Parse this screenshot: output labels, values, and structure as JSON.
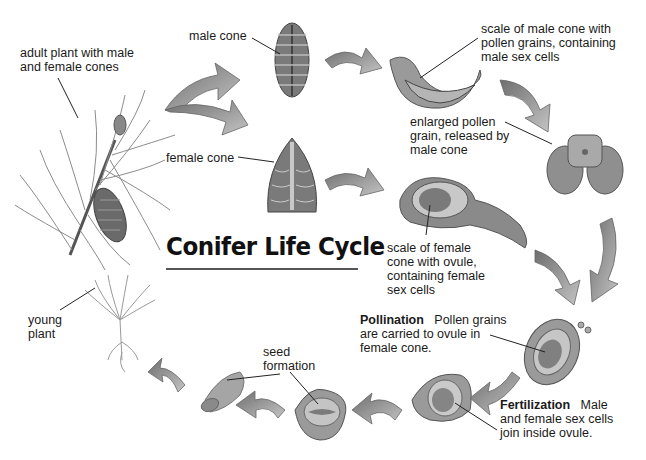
{
  "title": "Conifer Life Cycle",
  "labels": {
    "adult_plant": [
      "adult plant with male",
      "and female cones"
    ],
    "male_cone": "male cone",
    "female_cone": "female cone",
    "male_scale": [
      "scale of male cone with",
      "pollen grains, containing",
      "male sex cells"
    ],
    "pollen_grain": [
      "enlarged pollen",
      "grain, released by",
      "male cone"
    ],
    "female_scale": [
      "scale of female",
      "cone with ovule,",
      "containing female",
      "sex cells"
    ],
    "pollination": {
      "term": "Pollination",
      "text1": "Pollen grains",
      "text2": "are carried to ovule in",
      "text3": "female cone."
    },
    "fertilization": {
      "term": "Fertilization",
      "text1": "Male",
      "text2": "and female sex cells",
      "text3": "join inside ovule."
    },
    "seed_formation": [
      "seed",
      "formation"
    ],
    "young_plant": [
      "young",
      "plant"
    ]
  },
  "stages": [
    "adult plant",
    "male cone",
    "female cone",
    "male cone scale",
    "pollen grain",
    "female cone scale",
    "pollination",
    "fertilization",
    "seed formation",
    "seed",
    "young plant"
  ],
  "colors": {
    "arrow": "#8a8a8a",
    "illustration": "#9a9a9a",
    "text": "#1a1a1a"
  }
}
